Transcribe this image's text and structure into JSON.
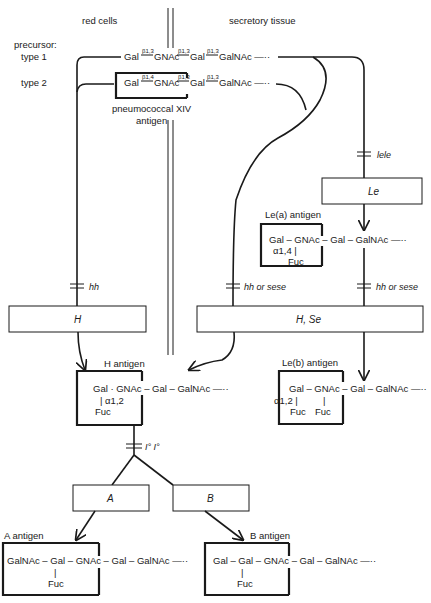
{
  "headers": {
    "left": "red cells",
    "right": "secretory tissue"
  },
  "precursor": {
    "label": "precursor:",
    "type1_label": "type 1",
    "type2_label": "type 2",
    "type1_chain": {
      "parts": [
        "Gal",
        "GNAc",
        "Gal",
        "GalNAc —··"
      ],
      "links": [
        "β1,3",
        "β1,3",
        "β1,3"
      ]
    },
    "type2_chain": {
      "parts": [
        "Gal",
        "GNAc",
        "Gal",
        "GalNAc —··"
      ],
      "links": [
        "β1,4",
        "β1,3",
        "β1,3"
      ]
    },
    "pneumococcal_label_1": "pneumococcal XIV",
    "pneumococcal_label_2": "antigen"
  },
  "genes": {
    "lele": "lele",
    "hh": "hh",
    "hh_or_sese_left": "hh or sese",
    "hh_or_sese_right": "hh or sese",
    "IoIo": "I° I°"
  },
  "enzymes": {
    "Le": "Le",
    "H": "H",
    "HSe": "H, Se",
    "A": "A",
    "B": "B"
  },
  "antigens": {
    "lea": {
      "title": "Le(a) antigen",
      "chain": "Gal – GNAc – Gal – GalNAc —··",
      "branch_link": "α1,4 |",
      "branch_sugar": "Fuc"
    },
    "h": {
      "title": "H antigen",
      "chain": "Gal · GNAc – Gal – GalNAc —··",
      "branch_link": "| α1,2",
      "branch_sugar": "Fuc"
    },
    "leb": {
      "title": "Le(b) antigen",
      "chain": "Gal – GNAc – Gal – GalNAc —··",
      "branch_link": "α1,2 |",
      "branch_bar2": "|",
      "branch_sugar1": "Fuc",
      "branch_sugar2": "Fuc"
    },
    "a": {
      "title": "A antigen",
      "chain": "GalNAc – Gal – GNAc – Gal – GalNAc —··",
      "branch_bar": "|",
      "branch_sugar": "Fuc"
    },
    "b": {
      "title": "B antigen",
      "chain": "Gal – Gal – GNAc – Gal – GalNAc —··",
      "branch_bar": "|",
      "branch_sugar": "Fuc"
    }
  }
}
